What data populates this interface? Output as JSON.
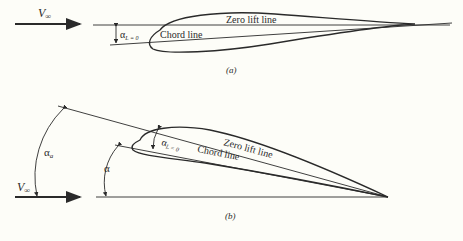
{
  "panel_a": {
    "caption": "(a)",
    "freestream_label": "V",
    "freestream_sub": "∞",
    "zero_lift_label": "Zero lift line",
    "chord_label": "Chord line",
    "angle_label": "α",
    "angle_sub": "L = 0"
  },
  "panel_b": {
    "caption": "(b)",
    "freestream_label": "V",
    "freestream_sub": "∞",
    "zero_lift_label": "Zero lift line",
    "chord_label": "Chord line",
    "angle_zero_lift_label": "α",
    "angle_zero_lift_sub": "L = 0",
    "angle_absolute_label": "α",
    "angle_absolute_sub": "a",
    "angle_geometric_label": "α"
  },
  "colors": {
    "ink": "#2a2a2a",
    "background": "#fdfdf8"
  }
}
